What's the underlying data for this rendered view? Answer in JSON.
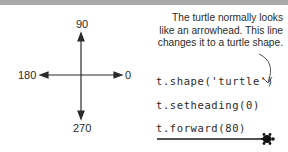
{
  "compass": {
    "north": "90",
    "south": "270",
    "west": "180",
    "east": "0"
  },
  "annotation": {
    "line1": "The turtle normally looks",
    "line2": "like an arrowhead. This line",
    "line3": "changes it to a turtle shape."
  },
  "code": [
    {
      "text": "t.shape('turtle')"
    },
    {
      "text": "t.setheading(0)"
    },
    {
      "text": "t.forward(80)"
    }
  ],
  "icons": {
    "compass_arrows": "four-direction-arrows",
    "pointer": "curved-arrow",
    "turtle": "turtle-shape"
  }
}
